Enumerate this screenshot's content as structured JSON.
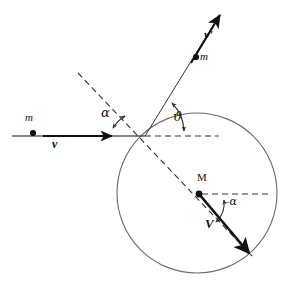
{
  "figure": {
    "background_color": "#ffffff",
    "stroke_color": "#111111",
    "circle_stroke_color": "#555555",
    "dash_pattern": "6 4"
  },
  "geometry": {
    "incoming_line": {
      "x1": 12,
      "y1": 136,
      "x2": 145,
      "y2": 136
    },
    "incoming_arrow_tip": {
      "x": 112,
      "y": 136
    },
    "impact_point": {
      "x": 145,
      "y": 136
    },
    "horizontal_dashed": {
      "x1": 145,
      "y1": 136,
      "x2": 219,
      "y2": 136
    },
    "normal_dashed": {
      "x1": 78,
      "y1": 73,
      "x2": 252,
      "y2": 256
    },
    "outgoing_line": {
      "x1": 145,
      "y1": 136,
      "x2": 219,
      "y2": 16
    },
    "circle": {
      "cx": 197,
      "cy": 193,
      "r": 80
    },
    "target_point": {
      "x": 199,
      "y": 194
    },
    "target_dashed": {
      "x1": 199,
      "y1": 194,
      "x2": 268,
      "y2": 194
    },
    "recoil_vector": {
      "x1": 199,
      "y1": 194,
      "x2": 249,
      "y2": 253
    },
    "incident_mass_dot": {
      "x": 33,
      "y": 133
    },
    "scattered_mass_dot": {
      "x": 196,
      "y": 57
    }
  },
  "labels": {
    "incident_mass": "m",
    "incident_velocity": "v",
    "scattered_mass": "m",
    "scattered_velocity": "v'",
    "target_mass": "M",
    "target_velocity": "V",
    "angle_alpha": "α",
    "angle_theta": "ϑ",
    "angle_minus_alpha": "–α"
  },
  "label_positions": {
    "incident_mass": {
      "x": 28,
      "y": 118
    },
    "incident_velocity": {
      "x": 54,
      "y": 140
    },
    "scattered_mass": {
      "x": 201,
      "y": 54
    },
    "scattered_velocity": {
      "x": 205,
      "y": 33
    },
    "target_mass": {
      "x": 199,
      "y": 177
    },
    "target_velocity": {
      "x": 208,
      "y": 222
    },
    "angle_alpha": {
      "x": 104,
      "y": 110
    },
    "angle_theta": {
      "x": 175,
      "y": 114
    },
    "angle_minus_alpha": {
      "x": 225,
      "y": 200
    }
  },
  "angles": {
    "alpha_arc": "arc between horizontal incoming line and upper-left dashed normal, double-headed",
    "theta_arc": "arc between horizontal dashed line and outgoing v' direction, double-headed",
    "minus_alpha_arc": "arc between recoil vector V and horizontal dashed line at M, double-headed"
  }
}
